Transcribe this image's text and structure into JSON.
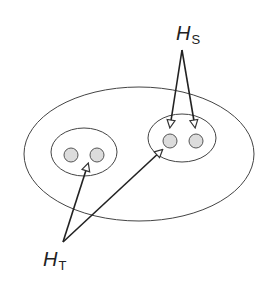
{
  "diagram": {
    "labels": {
      "hs": {
        "main": "H",
        "sub": "S"
      },
      "ht": {
        "main": "H",
        "sub": "T"
      }
    },
    "colors": {
      "stroke": "#333333",
      "node_fill": "#d9d9d9",
      "background": "#ffffff"
    },
    "groups": [
      {
        "name": "left-group",
        "nodes": 2
      },
      {
        "name": "right-group",
        "nodes": 2
      }
    ]
  }
}
